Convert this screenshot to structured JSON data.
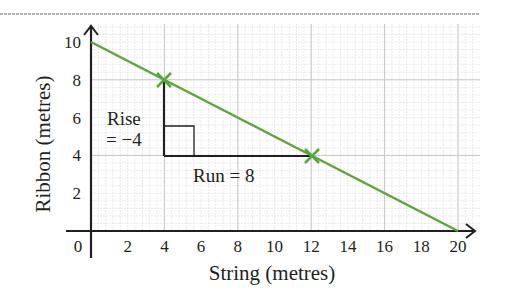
{
  "chart_data": {
    "type": "line",
    "title": "",
    "xlabel": "String (metres)",
    "ylabel": "Ribbon (metres)",
    "xlim": [
      0,
      20
    ],
    "ylim": [
      0,
      10
    ],
    "grid": true,
    "x_ticks": [
      "2",
      "4",
      "6",
      "8",
      "10",
      "12",
      "14",
      "16",
      "18",
      "20"
    ],
    "y_ticks": [
      "2",
      "4",
      "6",
      "8",
      "10"
    ],
    "origin_label": "0",
    "series": [
      {
        "name": "Ribbon vs String",
        "color": "#5aa63c",
        "x": [
          0,
          20
        ],
        "y": [
          10,
          0
        ]
      }
    ],
    "marked_points": [
      {
        "x": 4,
        "y": 8
      },
      {
        "x": 12,
        "y": 4
      }
    ],
    "annotations": {
      "rise_line1": "Rise",
      "rise_line2": "= −4",
      "run": "Run = 8"
    }
  },
  "colors": {
    "line": "#5aa63c",
    "axis": "#231f20",
    "grid_major": "#c8c8c8",
    "grid_minor": "#e2e2e2"
  }
}
